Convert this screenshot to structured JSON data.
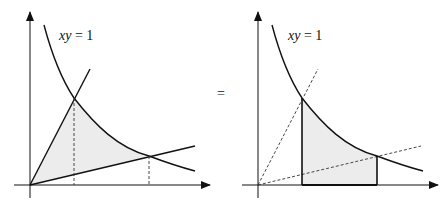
{
  "left_panel": {
    "curve_label_italic": "xy",
    "curve_label_rest": " = 1",
    "shaded_region": "region bounded by two lines through origin and hyperbola xy = 1",
    "fill_color": "#ececec",
    "stroke_color": "#111111"
  },
  "equals_sign": "=",
  "right_panel": {
    "curve_label_italic": "xy",
    "curve_label_rest": " = 1",
    "shaded_region": "region under hyperbola xy = 1 between the two intersection x-values",
    "fill_color": "#ececec",
    "stroke_color": "#111111"
  }
}
